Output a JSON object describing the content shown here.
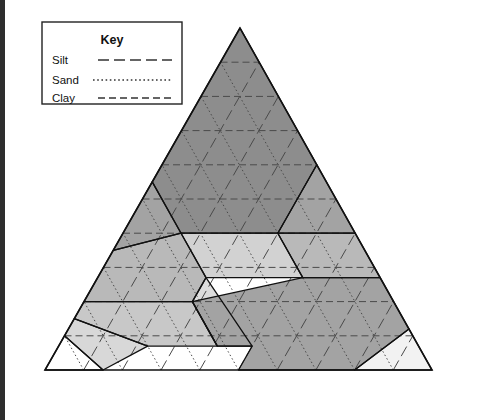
{
  "figure": {
    "border_color": "#2e2e2e"
  },
  "key": {
    "title": "Key",
    "items": [
      {
        "label": "Silt",
        "style": "long-dash",
        "color": "#333333"
      },
      {
        "label": "Sand",
        "style": "fine-dotted",
        "color": "#333333"
      },
      {
        "label": "Clay",
        "style": "medium-dash",
        "color": "#333333"
      }
    ]
  },
  "axes": {
    "bottom": {
      "label": "Percent sand",
      "ticks": [
        "100",
        "90",
        "80",
        "70",
        "60",
        "50",
        "40",
        "30",
        "20",
        "10",
        "0"
      ]
    },
    "left": {
      "label": "Percent clay",
      "ticks": [
        "0",
        "10",
        "20",
        "30",
        "40",
        "50",
        "60",
        "70",
        "80",
        "90",
        "100"
      ]
    },
    "right": {
      "label": "Percent silt",
      "ticks": [
        "0",
        "10",
        "20",
        "30",
        "40",
        "50",
        "60",
        "70",
        "80",
        "90",
        "100"
      ]
    }
  },
  "markers": [
    {
      "name": "sample-point-dot",
      "glyph": "dot",
      "sand": 41,
      "silt": 39,
      "clay": 20
    },
    {
      "name": "sample-point-cross",
      "glyph": "x",
      "sand": 38,
      "silt": 42,
      "clay": 20
    }
  ],
  "chart_data": {
    "type": "ternary",
    "components": [
      "Percent sand",
      "Percent silt",
      "Percent clay"
    ],
    "regions": [
      {
        "name": "Clay",
        "label": "Clay",
        "fill": "#8d8d8d",
        "label_sand": 20,
        "label_clay": 57,
        "vertices": [
          [
            0,
            0,
            100
          ],
          [
            0,
            40,
            60
          ],
          [
            20,
            40,
            40
          ],
          [
            45,
            15,
            40
          ],
          [
            45,
            0,
            55
          ]
        ]
      },
      {
        "name": "Silty clay",
        "label": "Silty clay",
        "fill": "#a3a3a3",
        "label_sand": 7,
        "label_clay": 45,
        "vertices": [
          [
            0,
            40,
            60
          ],
          [
            0,
            60,
            40
          ],
          [
            20,
            40,
            40
          ]
        ]
      },
      {
        "name": "Sandy clay",
        "label": "Sandy clay",
        "fill": "#a3a3a3",
        "label_sand": 52,
        "label_clay": 42,
        "vertices": [
          [
            45,
            0,
            55
          ],
          [
            45,
            15,
            40
          ],
          [
            65,
            0,
            35
          ]
        ]
      },
      {
        "name": "Silty clay loam",
        "label": "Silty clay loam",
        "fill": "#b9b9b9",
        "label_sand": 10,
        "label_clay": 33,
        "vertices": [
          [
            0,
            60,
            40
          ],
          [
            0,
            73,
            27
          ],
          [
            20,
            53,
            27
          ],
          [
            20,
            40,
            40
          ]
        ]
      },
      {
        "name": "Clay loam",
        "label": "Clay loam",
        "fill": "#d2d2d2",
        "label_sand": 32,
        "label_clay": 34,
        "vertices": [
          [
            20,
            40,
            40
          ],
          [
            20,
            53,
            27
          ],
          [
            45,
            28,
            27
          ],
          [
            45,
            15,
            40
          ]
        ]
      },
      {
        "name": "Sandy clay loam",
        "label": "Sandy clay loam",
        "fill": "#b9b9b9",
        "label_sand": 60,
        "label_clay": 27,
        "vertices": [
          [
            45,
            15,
            40
          ],
          [
            45,
            28,
            27
          ],
          [
            52,
            28,
            20
          ],
          [
            80,
            0,
            20
          ],
          [
            65,
            0,
            35
          ]
        ]
      },
      {
        "name": "Loam",
        "label": "Loam",
        "fill": "#dddddd",
        "label_sand": 42,
        "label_clay": 15,
        "vertices": [
          [
            45,
            28,
            27
          ],
          [
            52,
            28,
            20
          ],
          [
            52,
            41,
            7
          ],
          [
            43,
            50,
            7
          ]
        ]
      },
      {
        "name": "Silty loam",
        "label": "Silty loam",
        "fill": "#a3a3a3",
        "label_sand": 18,
        "label_clay": 13,
        "vertices": [
          [
            0,
            73,
            27
          ],
          [
            0,
            88,
            12
          ],
          [
            20,
            80,
            0
          ],
          [
            50,
            50,
            0
          ],
          [
            43,
            50,
            7
          ],
          [
            52,
            41,
            7
          ],
          [
            52,
            28,
            20
          ],
          [
            20,
            53,
            27
          ]
        ]
      },
      {
        "name": "Silt",
        "label": "Silt",
        "fill": "#f2f2f2",
        "label_sand": 8,
        "label_clay": 6,
        "vertices": [
          [
            0,
            88,
            12
          ],
          [
            0,
            100,
            0
          ],
          [
            20,
            80,
            0
          ]
        ]
      },
      {
        "name": "Sandy loam",
        "label": "Sandy loam",
        "fill": "#c8c8c8",
        "label_sand": 65,
        "label_clay": 12,
        "vertices": [
          [
            52,
            28,
            20
          ],
          [
            80,
            0,
            20
          ],
          [
            85,
            0,
            15
          ],
          [
            70,
            23,
            7
          ],
          [
            52,
            41,
            7
          ]
        ]
      },
      {
        "name": "Loamy sand",
        "label": "Loamy sand",
        "fill": "#d8d8d8",
        "label_sand": 82,
        "label_clay": 7,
        "vertices": [
          [
            85,
            0,
            15
          ],
          [
            90,
            0,
            10
          ],
          [
            85,
            15,
            0
          ],
          [
            70,
            23,
            7
          ]
        ]
      },
      {
        "name": "Sand",
        "label": "Sand",
        "fill": "#ffffff",
        "label_sand": 93,
        "label_clay": 4,
        "vertices": [
          [
            90,
            0,
            10
          ],
          [
            100,
            0,
            0
          ],
          [
            85,
            15,
            0
          ]
        ]
      }
    ],
    "gridlines": {
      "silt_style": "long-dash",
      "sand_style": "fine-dotted",
      "clay_style": "medium-dash",
      "interval": 10
    }
  }
}
